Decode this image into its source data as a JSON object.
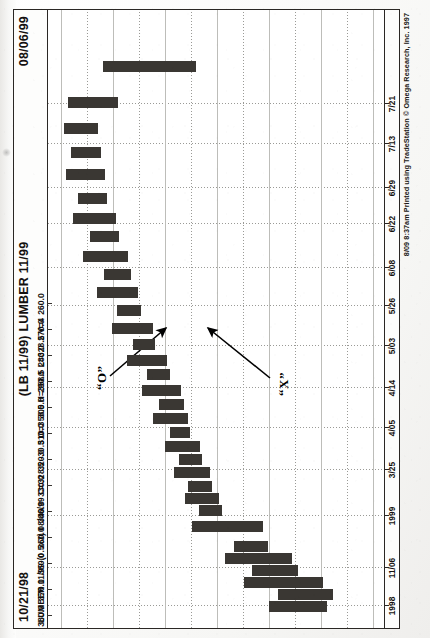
{
  "document": {
    "type": "point-and-figure-chart-printout",
    "orientation": "landscape sheet scanned in portrait (rotated 90 degrees)"
  },
  "header": {
    "date_left": "10/21/98",
    "title": "(LB 11/99) LUMBER 11/99",
    "date_right": "08/06/99"
  },
  "quote_line": "LUMBER 11/99-(0.5x3)  08/06/99  C=328.5 -30.5  O=358.5  H=358.5  L=328.5  V=4",
  "quote_fields": {
    "symbol": "LUMBER 11/99-(0.5x3)",
    "date": "08/06/99",
    "close": "C=328.5",
    "change": "-30.5",
    "open": "O=358.5",
    "high": "H=358.5",
    "low": "L=328.5",
    "volume": "V=4"
  },
  "footer": {
    "credit": "8/09 8:37am Printed using TradeStation © Omega Research, Inc. 1997"
  },
  "annotations": [
    {
      "id": "o-annotation",
      "label": "“O”",
      "label_x": 238,
      "label_y": 46,
      "arrow": {
        "x1": 252,
        "y1": 62,
        "x2": 300,
        "y2": 118
      }
    },
    {
      "id": "x-annotation",
      "label": "“X”",
      "label_x": 232,
      "label_y": 228,
      "arrow": {
        "x1": 250,
        "y1": 222,
        "x2": 300,
        "y2": 160
      }
    }
  ],
  "chart_data": {
    "type": "bar",
    "subtype": "point-and-figure",
    "title": "(LB 11/99) LUMBER 11/99",
    "xlabel": "",
    "ylabel": "",
    "box_size": 0.5,
    "reversal": 3,
    "grid": true,
    "legend": "none",
    "ylim": [
      255,
      385
    ],
    "yticks": [
      380.0,
      370.0,
      360.0,
      350.0,
      340.0,
      330.0,
      320.0,
      310.0,
      300.0,
      290.0,
      280.0,
      270.0,
      260.0
    ],
    "ytick_labels": [
      "380.0",
      "370.0",
      "360.0",
      "350.0",
      "340.0",
      "330.0",
      "320.0",
      "310.0",
      "300.0",
      "290.0",
      "280.0",
      "270.0",
      "260.0"
    ],
    "xtick_labels": [
      "1998",
      "11/06",
      "1999",
      "3/25",
      "4/05",
      "4/14",
      "5/03",
      "5/26",
      "6/08",
      "6/22",
      "6/29",
      "7/13",
      "7/21"
    ],
    "xtick_positions": [
      22,
      60,
      112,
      158,
      200,
      240,
      282,
      322,
      360,
      404,
      440,
      484,
      524
    ],
    "date_range": {
      "start": "10/21/98",
      "end": "08/06/99"
    },
    "last_quote": {
      "close": 328.5,
      "change": -30.5,
      "open": 358.5,
      "high": 358.5,
      "low": 328.5,
      "volume": 4
    },
    "columns": [
      {
        "mark": "X",
        "x": 16,
        "top": 300.0,
        "bottom": 278.0
      },
      {
        "mark": "O",
        "x": 28,
        "top": 296.5,
        "bottom": 275.5
      },
      {
        "mark": "X",
        "x": 40,
        "top": 309.5,
        "bottom": 279.5
      },
      {
        "mark": "O",
        "x": 52,
        "top": 306.5,
        "bottom": 289.0
      },
      {
        "mark": "X",
        "x": 64,
        "top": 317.0,
        "bottom": 291.5
      },
      {
        "mark": "O",
        "x": 76,
        "top": 313.5,
        "bottom": 300.5
      },
      {
        "mark": "X",
        "x": 96,
        "top": 329.5,
        "bottom": 302.5
      },
      {
        "mark": "O",
        "x": 112,
        "top": 327.0,
        "bottom": 318.5
      },
      {
        "mark": "X",
        "x": 124,
        "top": 332.5,
        "bottom": 319.5
      },
      {
        "mark": "O",
        "x": 136,
        "top": 331.0,
        "bottom": 322.0
      },
      {
        "mark": "X",
        "x": 150,
        "top": 336.5,
        "bottom": 323.0
      },
      {
        "mark": "O",
        "x": 163,
        "top": 334.5,
        "bottom": 326.0
      },
      {
        "mark": "X",
        "x": 176,
        "top": 340.0,
        "bottom": 327.0
      },
      {
        "mark": "O",
        "x": 190,
        "top": 338.0,
        "bottom": 330.5
      },
      {
        "mark": "X",
        "x": 204,
        "top": 344.5,
        "bottom": 331.5
      },
      {
        "mark": "O",
        "x": 218,
        "top": 342.5,
        "bottom": 333.0
      },
      {
        "mark": "X",
        "x": 232,
        "top": 349.0,
        "bottom": 334.0
      },
      {
        "mark": "O",
        "x": 248,
        "top": 347.0,
        "bottom": 338.5
      },
      {
        "mark": "X",
        "x": 262,
        "top": 354.5,
        "bottom": 339.5
      },
      {
        "mark": "O",
        "x": 278,
        "top": 352.5,
        "bottom": 344.0
      },
      {
        "mark": "X",
        "x": 294,
        "top": 360.5,
        "bottom": 345.0
      },
      {
        "mark": "O",
        "x": 312,
        "top": 358.5,
        "bottom": 349.5
      },
      {
        "mark": "X",
        "x": 330,
        "top": 366.0,
        "bottom": 350.5
      },
      {
        "mark": "O",
        "x": 348,
        "top": 363.5,
        "bottom": 353.5
      },
      {
        "mark": "X",
        "x": 366,
        "top": 371.5,
        "bottom": 354.5
      },
      {
        "mark": "O",
        "x": 386,
        "top": 369.0,
        "bottom": 358.0
      },
      {
        "mark": "X",
        "x": 404,
        "top": 375.5,
        "bottom": 359.0
      },
      {
        "mark": "O",
        "x": 424,
        "top": 373.5,
        "bottom": 362.5
      },
      {
        "mark": "X",
        "x": 448,
        "top": 378.0,
        "bottom": 363.5
      },
      {
        "mark": "O",
        "x": 470,
        "top": 376.0,
        "bottom": 365.0
      },
      {
        "mark": "X",
        "x": 494,
        "top": 379.0,
        "bottom": 366.0
      },
      {
        "mark": "O",
        "x": 520,
        "top": 377.5,
        "bottom": 358.5
      },
      {
        "mark": "X",
        "x": 556,
        "top": 364.0,
        "bottom": 328.5
      }
    ]
  }
}
